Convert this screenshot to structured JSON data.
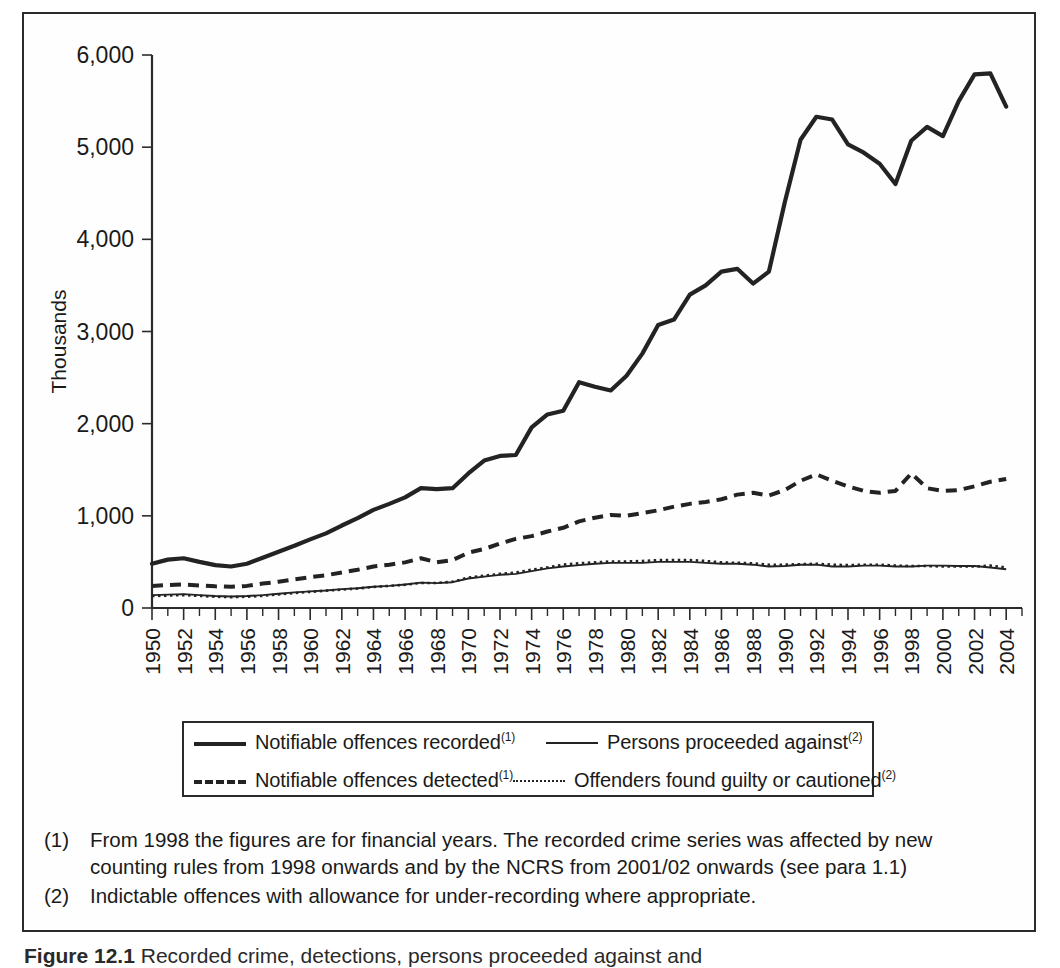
{
  "figure": {
    "caption_label": "Figure 12.1",
    "caption_text": "Recorded crime, detections, persons proceeded against and"
  },
  "axes": {
    "y_title": "Thousands",
    "x_title": "Year"
  },
  "legend": {
    "entries": [
      {
        "label": "Notifiable offences recorded",
        "footnote": "(1)",
        "style": "solid-thick"
      },
      {
        "label": "Persons proceeded against",
        "footnote": "(2)",
        "style": "solid-thin"
      },
      {
        "label": "Notifiable offences detected",
        "footnote": "(1)",
        "style": "dashed"
      },
      {
        "label": "Offenders found guilty or cautioned",
        "footnote": "(2)",
        "style": "dotted"
      }
    ]
  },
  "notes": [
    {
      "marker": "(1)",
      "text": "From 1998 the figures are for financial years. The recorded crime series was affected by new counting rules from 1998 onwards and by the NCRS from 2001/02 onwards (see para 1.1)"
    },
    {
      "marker": "(2)",
      "text": "Indictable offences with allowance for under-recording where appropriate."
    }
  ],
  "chart_data": {
    "type": "line",
    "title": "",
    "xlabel": "Year",
    "ylabel": "Thousands",
    "xlim": [
      1950,
      2005
    ],
    "ylim": [
      0,
      6000
    ],
    "ytick_values": [
      0,
      1000,
      2000,
      3000,
      4000,
      5000,
      6000
    ],
    "ytick_labels": [
      "0",
      "1,000",
      "2,000",
      "3,000",
      "4,000",
      "5,000",
      "6,000"
    ],
    "xtick_labels": [
      "1950",
      "1952",
      "1954",
      "1956",
      "1958",
      "1960",
      "1962",
      "1964",
      "1966",
      "1968",
      "1970",
      "1972",
      "1974",
      "1976",
      "1978",
      "1980",
      "1982",
      "1984",
      "1986",
      "1988",
      "1990",
      "1992",
      "1994",
      "1996",
      "1998",
      "2000",
      "2002",
      "2004"
    ],
    "xtick_step": 2,
    "x_minor_step": 1,
    "grid": false,
    "legend_position": "below",
    "x": [
      1950,
      1951,
      1952,
      1953,
      1954,
      1955,
      1956,
      1957,
      1958,
      1959,
      1960,
      1961,
      1962,
      1963,
      1964,
      1965,
      1966,
      1967,
      1968,
      1969,
      1970,
      1971,
      1972,
      1973,
      1974,
      1975,
      1976,
      1977,
      1978,
      1979,
      1980,
      1981,
      1982,
      1983,
      1984,
      1985,
      1986,
      1987,
      1988,
      1989,
      1990,
      1991,
      1992,
      1993,
      1994,
      1995,
      1996,
      1997,
      1998,
      1999,
      2000,
      2001,
      2002,
      2003,
      2004
    ],
    "series": [
      {
        "name": "Notifiable offences recorded",
        "footnote": "(1)",
        "style": "solid-thick",
        "values": [
          480,
          525,
          540,
          500,
          465,
          450,
          480,
          545,
          610,
          675,
          745,
          810,
          895,
          975,
          1065,
          1130,
          1200,
          1300,
          1290,
          1300,
          1460,
          1600,
          1650,
          1660,
          1960,
          2100,
          2140,
          2450,
          2400,
          2360,
          2520,
          2760,
          3070,
          3130,
          3400,
          3500,
          3650,
          3680,
          3520,
          3650,
          4400,
          5080,
          5330,
          5300,
          5030,
          4940,
          4820,
          4600,
          5070,
          5220,
          5120,
          5500,
          5790,
          5800,
          5440
        ]
      },
      {
        "name": "Notifiable offences detected",
        "footnote": "(1)",
        "style": "dashed",
        "values": [
          240,
          250,
          255,
          245,
          235,
          230,
          240,
          265,
          285,
          310,
          335,
          355,
          385,
          415,
          450,
          470,
          495,
          540,
          495,
          520,
          600,
          640,
          700,
          750,
          780,
          830,
          870,
          940,
          980,
          1010,
          1000,
          1030,
          1060,
          1100,
          1130,
          1150,
          1180,
          1230,
          1250,
          1220,
          1280,
          1380,
          1450,
          1380,
          1320,
          1270,
          1250,
          1270,
          1460,
          1300,
          1270,
          1280,
          1320,
          1370,
          1400
        ]
      },
      {
        "name": "Persons proceeded against",
        "footnote": "(2)",
        "style": "solid-thin",
        "values": [
          140,
          145,
          150,
          140,
          130,
          125,
          130,
          140,
          155,
          170,
          180,
          190,
          205,
          215,
          230,
          240,
          255,
          275,
          270,
          280,
          320,
          340,
          360,
          370,
          400,
          430,
          450,
          465,
          480,
          490,
          490,
          490,
          500,
          500,
          500,
          490,
          480,
          480,
          470,
          450,
          455,
          470,
          470,
          450,
          450,
          460,
          460,
          450,
          450,
          460,
          460,
          455,
          455,
          440,
          420
        ]
      },
      {
        "name": "Offenders found guilty or cautioned",
        "footnote": "(2)",
        "style": "dotted",
        "values": [
          130,
          135,
          140,
          132,
          122,
          118,
          122,
          132,
          148,
          162,
          175,
          188,
          200,
          212,
          228,
          240,
          252,
          272,
          272,
          285,
          330,
          350,
          370,
          385,
          415,
          440,
          470,
          485,
          495,
          505,
          505,
          510,
          520,
          520,
          520,
          510,
          495,
          490,
          485,
          470,
          470,
          475,
          480,
          470,
          465,
          470,
          470,
          460,
          455,
          455,
          450,
          450,
          450,
          460,
          440
        ]
      }
    ]
  }
}
